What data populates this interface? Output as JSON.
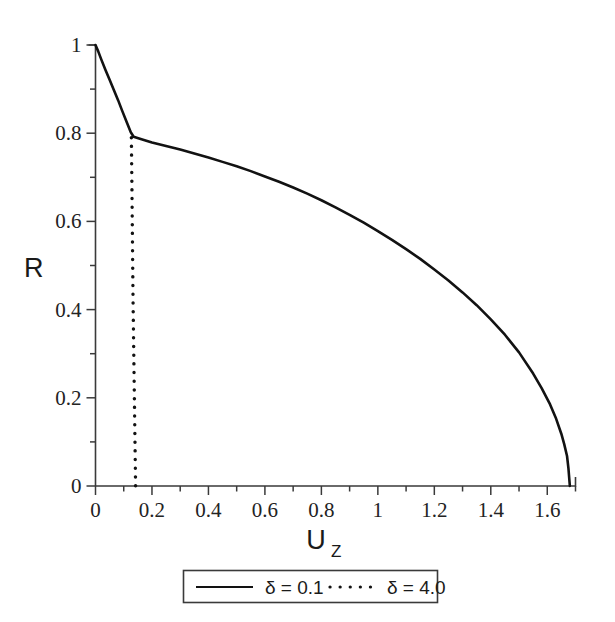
{
  "chart_data": {
    "type": "line",
    "title": "",
    "xlabel": "U",
    "xlabel_sub": "Z",
    "ylabel": "R",
    "xlim": [
      0,
      1.7
    ],
    "ylim": [
      0,
      1
    ],
    "grid": false,
    "legend_position": "below-axes",
    "xticks": [
      "0",
      "0.2",
      "0.4",
      "0.6",
      "0.8",
      "1",
      "1.2",
      "1.4",
      "1.6"
    ],
    "xtick_values": [
      0,
      0.2,
      0.4,
      0.6,
      0.8,
      1,
      1.2,
      1.4,
      1.6
    ],
    "xminor_step": 0.1,
    "yticks": [
      "0",
      "0.2",
      "0.4",
      "0.6",
      "0.8",
      "1"
    ],
    "ytick_values": [
      0,
      0.2,
      0.4,
      0.6,
      0.8,
      1
    ],
    "yminor_step": 0.1,
    "series": [
      {
        "name": "δ = 0.1",
        "style": "solid",
        "color": "#121212",
        "x": [
          0.0,
          0.01,
          0.02,
          0.035,
          0.05,
          0.065,
          0.08,
          0.095,
          0.11,
          0.125,
          0.135,
          0.16,
          0.2,
          0.25,
          0.3,
          0.35,
          0.4,
          0.45,
          0.5,
          0.55,
          0.6,
          0.65,
          0.7,
          0.75,
          0.8,
          0.85,
          0.9,
          0.95,
          1.0,
          1.05,
          1.1,
          1.15,
          1.2,
          1.25,
          1.3,
          1.35,
          1.4,
          1.45,
          1.5,
          1.55,
          1.58,
          1.61,
          1.63,
          1.65,
          1.66,
          1.67,
          1.675,
          1.68
        ],
        "y": [
          1.0,
          0.985,
          0.968,
          0.944,
          0.921,
          0.898,
          0.875,
          0.85,
          0.826,
          0.802,
          0.792,
          0.787,
          0.779,
          0.771,
          0.763,
          0.754,
          0.745,
          0.735,
          0.725,
          0.714,
          0.702,
          0.69,
          0.677,
          0.663,
          0.648,
          0.632,
          0.615,
          0.597,
          0.578,
          0.558,
          0.537,
          0.515,
          0.491,
          0.466,
          0.439,
          0.41,
          0.378,
          0.343,
          0.303,
          0.255,
          0.222,
          0.185,
          0.155,
          0.118,
          0.095,
          0.068,
          0.04,
          0.0
        ]
      },
      {
        "name": "δ = 4.0",
        "style": "dotted",
        "color": "#121212",
        "x": [
          0.127,
          0.129,
          0.131,
          0.133,
          0.136,
          0.139,
          0.142
        ],
        "y": [
          0.79,
          0.68,
          0.55,
          0.42,
          0.28,
          0.14,
          0.0
        ]
      }
    ]
  },
  "legend": {
    "entries": [
      {
        "label": "δ = 0.1",
        "style": "solid"
      },
      {
        "label": "δ = 4.0",
        "style": "dotted"
      }
    ]
  }
}
